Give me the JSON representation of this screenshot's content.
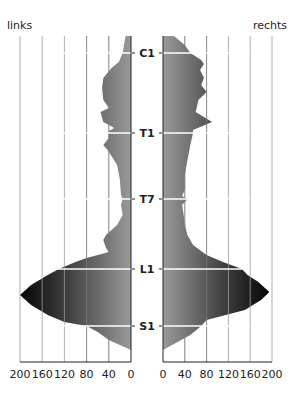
{
  "chart_data": {
    "type": "area",
    "title": "",
    "side_labels": {
      "left": "links",
      "right": "rechts"
    },
    "x_ticks": [
      "200",
      "160",
      "120",
      "80",
      "40",
      "0"
    ],
    "x_ticks_right": [
      "0",
      "40",
      "80",
      "120",
      "160",
      "200"
    ],
    "xlim": [
      0,
      200
    ],
    "grid": true,
    "levels": [
      {
        "label": "C1",
        "y": 53
      },
      {
        "label": "T1",
        "y": 133
      },
      {
        "label": "T7",
        "y": 199
      },
      {
        "label": "L1",
        "y": 269
      },
      {
        "label": "S1",
        "y": 326
      }
    ],
    "series": [
      {
        "name": "links",
        "points": [
          [
            36,
            10
          ],
          [
            53,
            15
          ],
          [
            62,
            22
          ],
          [
            68,
            35
          ],
          [
            78,
            50
          ],
          [
            88,
            52
          ],
          [
            100,
            50
          ],
          [
            108,
            40
          ],
          [
            112,
            55
          ],
          [
            122,
            50
          ],
          [
            128,
            30
          ],
          [
            131,
            40
          ],
          [
            133,
            40
          ],
          [
            138,
            40
          ],
          [
            145,
            50
          ],
          [
            150,
            42
          ],
          [
            165,
            25
          ],
          [
            180,
            20
          ],
          [
            195,
            18
          ],
          [
            199,
            15
          ],
          [
            205,
            18
          ],
          [
            215,
            15
          ],
          [
            225,
            25
          ],
          [
            235,
            45
          ],
          [
            240,
            50
          ],
          [
            248,
            45
          ],
          [
            252,
            40
          ],
          [
            258,
            80
          ],
          [
            262,
            100
          ],
          [
            269,
            130
          ],
          [
            275,
            150
          ],
          [
            285,
            180
          ],
          [
            295,
            200
          ],
          [
            305,
            180
          ],
          [
            315,
            150
          ],
          [
            322,
            120
          ],
          [
            326,
            80
          ],
          [
            332,
            60
          ],
          [
            340,
            40
          ],
          [
            350,
            0
          ]
        ]
      },
      {
        "name": "rechts",
        "points": [
          [
            36,
            20
          ],
          [
            45,
            40
          ],
          [
            53,
            50
          ],
          [
            60,
            70
          ],
          [
            64,
            75
          ],
          [
            70,
            68
          ],
          [
            78,
            75
          ],
          [
            85,
            70
          ],
          [
            92,
            80
          ],
          [
            100,
            65
          ],
          [
            112,
            60
          ],
          [
            122,
            90
          ],
          [
            130,
            55
          ],
          [
            133,
            55
          ],
          [
            145,
            50
          ],
          [
            160,
            45
          ],
          [
            175,
            40
          ],
          [
            190,
            40
          ],
          [
            196,
            35
          ],
          [
            199,
            45
          ],
          [
            205,
            35
          ],
          [
            215,
            38
          ],
          [
            225,
            40
          ],
          [
            235,
            45
          ],
          [
            245,
            55
          ],
          [
            255,
            80
          ],
          [
            262,
            110
          ],
          [
            269,
            145
          ],
          [
            275,
            155
          ],
          [
            282,
            175
          ],
          [
            292,
            195
          ],
          [
            300,
            180
          ],
          [
            310,
            150
          ],
          [
            320,
            80
          ],
          [
            326,
            70
          ],
          [
            335,
            50
          ],
          [
            350,
            0
          ]
        ]
      }
    ]
  }
}
